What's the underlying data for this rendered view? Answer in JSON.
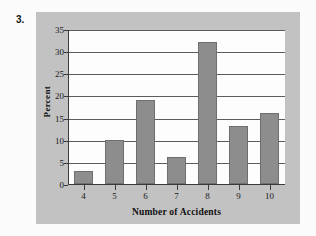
{
  "problem": {
    "number_label": "3."
  },
  "chart_data": {
    "type": "bar",
    "title": "",
    "subtitle": "",
    "xlabel": "Number of Accidents",
    "ylabel": "Percent",
    "categories": [
      "4",
      "5",
      "6",
      "7",
      "8",
      "9",
      "10"
    ],
    "values": [
      3,
      10,
      19,
      6,
      32,
      13,
      16
    ],
    "series": [
      {
        "name": "Percent",
        "values": [
          3,
          10,
          19,
          6,
          32,
          13,
          16
        ]
      }
    ],
    "ylim": [
      0,
      35
    ],
    "ytick_labels": [
      "0",
      "5",
      "10",
      "15",
      "20",
      "25",
      "30",
      "35"
    ],
    "ytick_values": [
      0,
      5,
      10,
      15,
      20,
      25,
      30,
      35
    ],
    "xtick_labels": [
      "4",
      "5",
      "6",
      "7",
      "8",
      "9",
      "10"
    ],
    "grid": true,
    "grid_axis": "y",
    "legend": false,
    "legend_position": "none",
    "annotations": []
  },
  "style": {
    "page_background": "#fbfbfb",
    "panel_background": "#c2c2c2",
    "plot_background": "#fdfdfd",
    "bar_fill": "#8d8d8d",
    "bar_border": "#6f6f6f",
    "gridline_color": "#5c5c5c",
    "axis_color": "#3a3a3a",
    "text_color": "#1a1a1a"
  }
}
